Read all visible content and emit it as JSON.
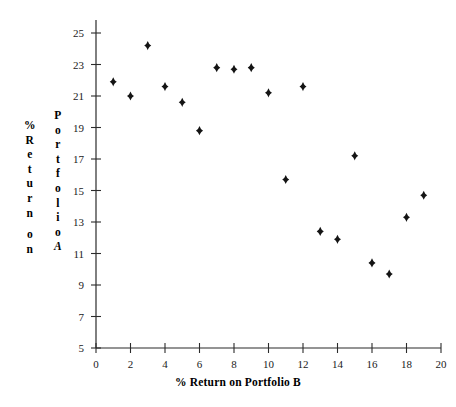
{
  "chart_data": {
    "type": "scatter",
    "title": "",
    "xlabel": "% Return on Portfolio B",
    "ylabel": "% Return on Portfolio A",
    "xlim": [
      0,
      20
    ],
    "ylim": [
      5,
      25
    ],
    "xticks": [
      0,
      2,
      4,
      6,
      8,
      10,
      12,
      14,
      16,
      18,
      20
    ],
    "yticks": [
      5,
      7,
      9,
      11,
      13,
      15,
      17,
      19,
      21,
      23,
      25
    ],
    "grid": false,
    "legend": null,
    "marker": "diamond",
    "marker_color": "#141414",
    "points": [
      {
        "x": 1,
        "y": 21.9
      },
      {
        "x": 2,
        "y": 21.0
      },
      {
        "x": 3,
        "y": 24.2
      },
      {
        "x": 4,
        "y": 21.6
      },
      {
        "x": 5,
        "y": 20.6
      },
      {
        "x": 6,
        "y": 18.8
      },
      {
        "x": 7,
        "y": 22.8
      },
      {
        "x": 8,
        "y": 22.7
      },
      {
        "x": 9,
        "y": 22.8
      },
      {
        "x": 10,
        "y": 21.2
      },
      {
        "x": 11,
        "y": 15.7
      },
      {
        "x": 12,
        "y": 21.6
      },
      {
        "x": 13,
        "y": 12.4
      },
      {
        "x": 14,
        "y": 11.9
      },
      {
        "x": 15,
        "y": 17.2
      },
      {
        "x": 16,
        "y": 10.4
      },
      {
        "x": 17,
        "y": 9.7
      },
      {
        "x": 18,
        "y": 13.3
      },
      {
        "x": 19,
        "y": 14.7
      }
    ]
  },
  "ylabel_chars_left": [
    "%",
    "R",
    "e",
    "t",
    "u",
    "r",
    "n",
    "",
    "o",
    "n"
  ],
  "ylabel_chars_right": [
    "P",
    "o",
    "r",
    "t",
    "f",
    "o",
    "l",
    "i",
    "o",
    "A"
  ],
  "axis": {
    "x_title": "% Return on Portfolio B"
  },
  "colors": {
    "marker": "#141414",
    "axis": "#2b2b2b",
    "background": "#ffffff"
  }
}
